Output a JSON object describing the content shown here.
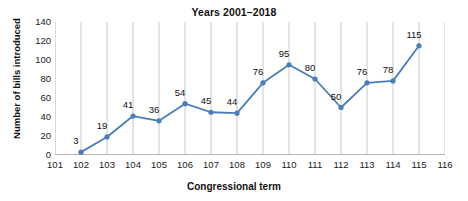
{
  "chart_data": {
    "type": "line",
    "title": "Years 2001–2018",
    "xlabel": "Congressional term",
    "ylabel": "Number of bills introduced",
    "x": [
      102,
      103,
      104,
      105,
      106,
      107,
      108,
      109,
      110,
      111,
      112,
      113,
      114,
      115
    ],
    "values": [
      3,
      19,
      41,
      36,
      54,
      45,
      44,
      76,
      95,
      80,
      50,
      76,
      78,
      115
    ],
    "point_labels": [
      "3",
      "19",
      "41",
      "36",
      "54",
      "45",
      "44",
      "76",
      "95",
      "80",
      "50",
      "76",
      "78",
      "115"
    ],
    "xticks": [
      "101",
      "102",
      "103",
      "104",
      "105",
      "106",
      "107",
      "108",
      "109",
      "110",
      "111",
      "112",
      "113",
      "114",
      "115",
      "116"
    ],
    "yticks": [
      "0",
      "20",
      "40",
      "60",
      "80",
      "100",
      "120",
      "140"
    ],
    "xlim": [
      101,
      116
    ],
    "ylim": [
      0,
      140
    ],
    "grid": "vertical-only",
    "legend": "none",
    "series_color": "#4a7ebb",
    "marker": "circle",
    "gridline_color": "#c8c8c8",
    "axis_color": "#b4b4b4"
  }
}
